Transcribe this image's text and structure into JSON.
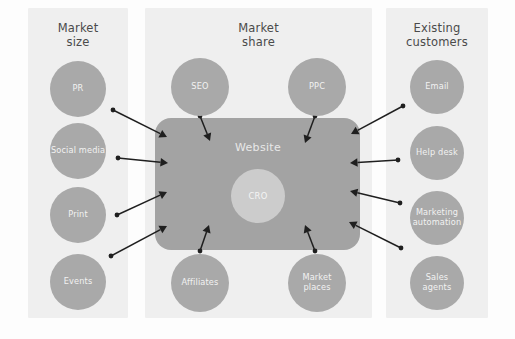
{
  "diagram": {
    "background_color": "#fdfdfd",
    "panel_color": "#efefef",
    "node_color": "#a9a9a9",
    "hub_color": "#a3a3a3",
    "core_color": "#cccccc",
    "arrow_color": "#1f1f1f"
  },
  "panels": [
    {
      "id": "market-size",
      "title": "Market\nsize",
      "x": 28,
      "y": 8,
      "w": 100,
      "h": 310
    },
    {
      "id": "market-share",
      "title": "Market\nshare",
      "x": 145,
      "y": 8,
      "w": 227,
      "h": 310
    },
    {
      "id": "existing-customers",
      "title": "Existing\ncustomers",
      "x": 386,
      "y": 8,
      "w": 102,
      "h": 310
    }
  ],
  "nodes": [
    {
      "id": "pr",
      "label": "PR",
      "cx": 78,
      "cy": 89,
      "r": 28,
      "panel": "market-size"
    },
    {
      "id": "social-media",
      "label": "Social media",
      "cx": 78,
      "cy": 151,
      "r": 28,
      "panel": "market-size"
    },
    {
      "id": "print",
      "label": "Print",
      "cx": 78,
      "cy": 215,
      "r": 28,
      "panel": "market-size"
    },
    {
      "id": "events",
      "label": "Events",
      "cx": 78,
      "cy": 282,
      "r": 28,
      "panel": "market-size"
    },
    {
      "id": "seo",
      "label": "SEO",
      "cx": 200,
      "cy": 87,
      "r": 29,
      "panel": "market-share"
    },
    {
      "id": "ppc",
      "label": "PPC",
      "cx": 317,
      "cy": 87,
      "r": 29,
      "panel": "market-share"
    },
    {
      "id": "affiliates",
      "label": "Affiliates",
      "cx": 200,
      "cy": 283,
      "r": 29,
      "panel": "market-share"
    },
    {
      "id": "market-places",
      "label": "Market\nplaces",
      "cx": 317,
      "cy": 283,
      "r": 29,
      "panel": "market-share"
    },
    {
      "id": "email",
      "label": "Email",
      "cx": 437,
      "cy": 87,
      "r": 27,
      "panel": "existing-customers"
    },
    {
      "id": "help-desk",
      "label": "Help desk",
      "cx": 437,
      "cy": 153,
      "r": 27,
      "panel": "existing-customers"
    },
    {
      "id": "marketing-automation",
      "label": "Marketing\nautomation",
      "cx": 437,
      "cy": 218,
      "r": 27,
      "panel": "existing-customers"
    },
    {
      "id": "sales-agents",
      "label": "Sales\nagents",
      "cx": 437,
      "cy": 283,
      "r": 27,
      "panel": "existing-customers"
    }
  ],
  "hub": {
    "id": "website",
    "label": "Website",
    "x": 155,
    "y": 118,
    "w": 205,
    "h": 132,
    "label_x": 258,
    "label_y": 148
  },
  "core": {
    "id": "cro",
    "label": "CRO",
    "cx": 258,
    "cy": 196,
    "r": 27
  },
  "connections": [
    {
      "id": "pr-to-website",
      "from": "pr",
      "to": "website",
      "x1": 113,
      "y1": 110,
      "x2": 167,
      "y2": 137
    },
    {
      "id": "social-media-to-website",
      "from": "social-media",
      "to": "website",
      "x1": 118,
      "y1": 158,
      "x2": 168,
      "y2": 163
    },
    {
      "id": "print-to-website",
      "from": "print",
      "to": "website",
      "x1": 117,
      "y1": 215,
      "x2": 167,
      "y2": 192
    },
    {
      "id": "events-to-website",
      "from": "events",
      "to": "website",
      "x1": 111,
      "y1": 256,
      "x2": 167,
      "y2": 226
    },
    {
      "id": "seo-to-website",
      "from": "seo",
      "to": "website",
      "x1": 200,
      "y1": 116,
      "x2": 210,
      "y2": 141
    },
    {
      "id": "ppc-to-website",
      "from": "ppc",
      "to": "website",
      "x1": 315,
      "y1": 116,
      "x2": 305,
      "y2": 143
    },
    {
      "id": "affiliates-to-website",
      "from": "affiliates",
      "to": "website",
      "x1": 200,
      "y1": 251,
      "x2": 209,
      "y2": 225
    },
    {
      "id": "market-places-to-website",
      "from": "market-places",
      "to": "website",
      "x1": 315,
      "y1": 251,
      "x2": 305,
      "y2": 225
    },
    {
      "id": "email-to-website",
      "from": "email",
      "to": "website",
      "x1": 403,
      "y1": 106,
      "x2": 351,
      "y2": 134
    },
    {
      "id": "help-desk-to-website",
      "from": "help-desk",
      "to": "website",
      "x1": 398,
      "y1": 160,
      "x2": 350,
      "y2": 163
    },
    {
      "id": "marketing-automation-to-website",
      "from": "marketing-automation",
      "to": "website",
      "x1": 400,
      "y1": 203,
      "x2": 350,
      "y2": 191
    },
    {
      "id": "sales-agents-to-website",
      "from": "sales-agents",
      "to": "website",
      "x1": 401,
      "y1": 248,
      "x2": 349,
      "y2": 222
    }
  ]
}
